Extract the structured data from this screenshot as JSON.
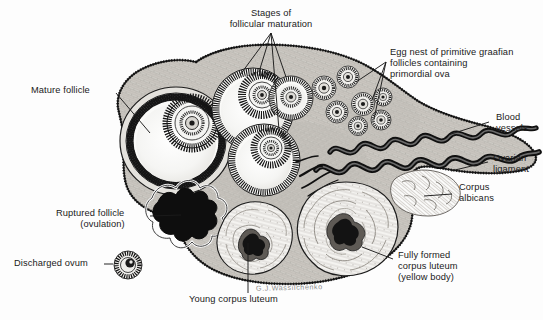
{
  "figure": {
    "background_color": "#fdfdfd",
    "ink_color": "#1a1a1a",
    "signature": "G.J.Wassilchenko"
  },
  "labels": {
    "mature_follicle": "Mature follicle",
    "stages_line1": "Stages of",
    "stages_line2": "follicular maturation",
    "egg_nest_line1": "Egg nest of primitive graafian",
    "egg_nest_line2": "follicles containing",
    "egg_nest_line3": "primordial ova",
    "blood_line1": "Blood",
    "blood_line2": "vessels",
    "ovarian_line1": "Ovarian",
    "ovarian_line2": "ligament",
    "corpus_albicans_line1": "Corpus",
    "corpus_albicans_line2": "albicans",
    "ruptured_line1": "Ruptured follicle",
    "ruptured_line2": "(ovulation)",
    "discharged_ovum": "Discharged ovum",
    "young_corpus_luteum": "Young corpus luteum",
    "fully_formed_line1": "Fully formed",
    "fully_formed_line2": "corpus luteum",
    "fully_formed_line3": "(yellow body)"
  },
  "structures": [
    {
      "name": "mature-follicle",
      "description": "Large follicle with antrum and oocyte, left side"
    },
    {
      "name": "maturing-follicle-upper",
      "description": "Developing graafian follicle, upper middle"
    },
    {
      "name": "maturing-follicle-lower",
      "description": "Developing graafian follicle, center"
    },
    {
      "name": "maturing-follicle-small",
      "description": "Smaller developing follicle, upper right"
    },
    {
      "name": "egg-nest",
      "description": "Cluster of primordial follicles at upper right cortex"
    },
    {
      "name": "blood-vessels",
      "description": "Coiled helical vessels in the hilum"
    },
    {
      "name": "ovarian-ligament",
      "description": "Ligament band extending right"
    },
    {
      "name": "corpus-albicans",
      "description": "Pale fibrous scar body, right lower"
    },
    {
      "name": "ruptured-follicle",
      "description": "Dark jagged collapsed follicle after ovulation"
    },
    {
      "name": "discharged-ovum",
      "description": "Free ovum with corona radiata, lower left"
    },
    {
      "name": "young-corpus-luteum",
      "description": "Convoluted body with dark central clot, bottom center"
    },
    {
      "name": "fully-formed-corpus-luteum",
      "description": "Large convoluted yellow body, bottom right"
    }
  ],
  "colors": {
    "stroma_light": "#d9d7d2",
    "stroma_mid": "#bdbab4",
    "granulosa_dark": "#1c1c1c",
    "antrum": "#f6f6f4",
    "vessel": "#121212",
    "albicans": "#fbfbfa"
  }
}
